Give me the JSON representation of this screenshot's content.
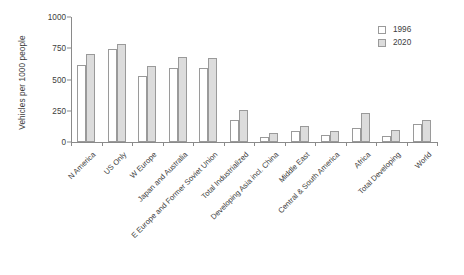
{
  "chart_data": {
    "type": "bar",
    "title": "",
    "xlabel": "",
    "ylabel": "Vehicles per 1000 people",
    "ylim": [
      0,
      1000
    ],
    "yticks": [
      0,
      250,
      500,
      750,
      1000
    ],
    "grid": false,
    "legend_position": "top-right",
    "categories": [
      "N America",
      "US Only",
      "W Europe",
      "Japan and Australia",
      "E Europe and Former Soviet Union",
      "Total Industrialized",
      "Developing Asia incl. China",
      "Middle East",
      "Central & South America",
      "Africa",
      "Total Developing",
      "World"
    ],
    "series": [
      {
        "name": "1996",
        "color": "#ffffff",
        "values": [
          620,
          745,
          530,
          590,
          590,
          180,
          40,
          85,
          55,
          110,
          45,
          145
        ]
      },
      {
        "name": "2020",
        "color": "#dcdcdc",
        "values": [
          705,
          785,
          610,
          680,
          670,
          255,
          75,
          130,
          85,
          235,
          95,
          175
        ]
      }
    ]
  },
  "legend": {
    "items": [
      {
        "label": "1996"
      },
      {
        "label": "2020"
      }
    ]
  }
}
